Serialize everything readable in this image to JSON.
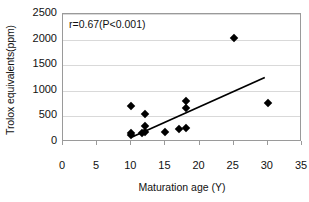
{
  "chart_data": {
    "type": "scatter",
    "title": "",
    "xlabel": "Maturation age (Y)",
    "ylabel": "Trolox equivalents(ppm)",
    "xlim": [
      0,
      35
    ],
    "ylim": [
      0,
      2500
    ],
    "xticks": [
      0,
      5,
      10,
      15,
      20,
      25,
      30,
      35
    ],
    "yticks": [
      0,
      500,
      1000,
      1500,
      2000,
      2500
    ],
    "xtick_labels": [
      "0",
      "5",
      "10",
      "15",
      "20",
      "25",
      "30",
      "35"
    ],
    "ytick_labels": [
      "0",
      "500",
      "1000",
      "1500",
      "2000",
      "2500"
    ],
    "grid": "horizontal",
    "legend": "none",
    "annotations": [
      {
        "text": "r=0.67(P<0.001)",
        "x": 1.0,
        "y": 2330
      }
    ],
    "marker": "diamond",
    "marker_color": "#000000",
    "points": [
      {
        "x": 10,
        "y": 140
      },
      {
        "x": 10,
        "y": 175
      },
      {
        "x": 10,
        "y": 700
      },
      {
        "x": 11.6,
        "y": 170
      },
      {
        "x": 12,
        "y": 190
      },
      {
        "x": 12,
        "y": 320
      },
      {
        "x": 12,
        "y": 550
      },
      {
        "x": 15,
        "y": 190
      },
      {
        "x": 17,
        "y": 260
      },
      {
        "x": 18,
        "y": 270
      },
      {
        "x": 18,
        "y": 660
      },
      {
        "x": 18,
        "y": 810
      },
      {
        "x": 25,
        "y": 2030
      },
      {
        "x": 30,
        "y": 760
      }
    ],
    "trendline": {
      "x0": 10.2,
      "y0": 60,
      "x1": 29.8,
      "y1": 1240,
      "color": "#000000",
      "width": 1.8
    }
  }
}
